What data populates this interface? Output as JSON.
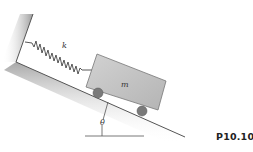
{
  "diagram": {
    "spring_label": "k",
    "mass_label": "m",
    "angle_label": "θ",
    "figure_label": "P10.10"
  },
  "colors": {
    "wall_shading": "#b8b8b8",
    "cart_fill": "#c4c4c4",
    "wheel_fill": "#777777",
    "line": "#444444"
  }
}
